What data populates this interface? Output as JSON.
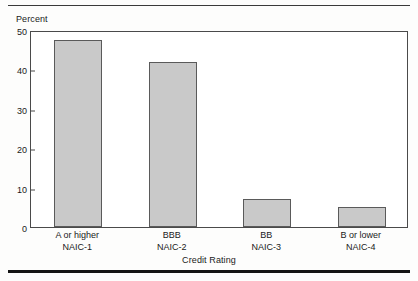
{
  "figure": {
    "background_color": "#fdfdfc",
    "rule_color": "#3a3a3a"
  },
  "chart_data": {
    "type": "bar",
    "title": "",
    "subtitle": "",
    "xlabel": "Credit Rating",
    "ylabel": "Percent",
    "categories": [
      "A or higher\nNAIC-1",
      "BBB\nNAIC-2",
      "BB\nNAIC-3",
      "B or lower\nNAIC-4"
    ],
    "category_lines": [
      {
        "line1": "A or higher",
        "line2": "NAIC-1"
      },
      {
        "line1": "BBB",
        "line2": "NAIC-2"
      },
      {
        "line1": "BB",
        "line2": "NAIC-3"
      },
      {
        "line1": "B or lower",
        "line2": "NAIC-4"
      }
    ],
    "values": [
      47.5,
      41.8,
      7.2,
      5.0
    ],
    "ylim": [
      0,
      50
    ],
    "yticks": [
      0,
      10,
      20,
      30,
      40,
      50
    ],
    "ytick_labels": [
      "0",
      "10",
      "20",
      "30",
      "40",
      "50"
    ],
    "grid": false,
    "legend": null,
    "bar_fill_color": "#c9c9c9",
    "bar_edge_color": "#5a5a5a",
    "axis_color": "#4a4a4a"
  }
}
